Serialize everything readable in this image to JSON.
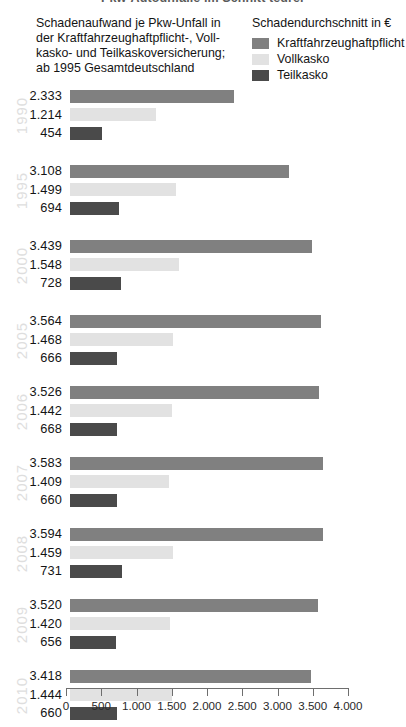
{
  "kicker": "Pkw-Autounfälle im Schnitt teurer",
  "title_lines": [
    "Schadenaufwand je Pkw-Unfall in",
    "der Kraftfahrzeughaftpflicht-, Voll-",
    "kasko- und Teilkaskoversicherung;",
    "ab 1995 Gesamtdeutschland"
  ],
  "legend": {
    "title": "Schadendurchschnitt in €",
    "items": [
      {
        "label": "Kraftfahrzeughaftpflicht",
        "color": "#808080",
        "icon": "legend-swatch-icon"
      },
      {
        "label": "Vollkasko",
        "color": "#e2e2e2",
        "icon": "legend-swatch-icon"
      },
      {
        "label": "Teilkasko",
        "color": "#4a4a4a",
        "icon": "legend-swatch-icon"
      }
    ]
  },
  "chart_data": {
    "type": "bar",
    "orientation": "horizontal",
    "xlabel": "Schadendurchschnitt in €",
    "ylabel": "",
    "xlim": [
      0,
      4000
    ],
    "grid": false,
    "legend_position": "top-right",
    "tick_labels": [
      "0",
      "500",
      "1.000",
      "1.500",
      "2.000",
      "2.500",
      "3.000",
      "3.500",
      "4.000"
    ],
    "tick_values": [
      0,
      500,
      1000,
      1500,
      2000,
      2500,
      3000,
      3500,
      4000
    ],
    "categories": [
      "1990",
      "1995",
      "2000",
      "2005",
      "2006",
      "2007",
      "2008",
      "2009",
      "2010"
    ],
    "series": [
      {
        "name": "Kraftfahrzeughaftpflicht",
        "color": "#808080",
        "values": [
          2333,
          3108,
          3439,
          3564,
          3526,
          3583,
          3594,
          3520,
          3418
        ],
        "labels": [
          "2.333",
          "3.108",
          "3.439",
          "3.564",
          "3.526",
          "3.583",
          "3.594",
          "3.520",
          "3.418"
        ]
      },
      {
        "name": "Vollkasko",
        "color": "#e2e2e2",
        "values": [
          1214,
          1499,
          1548,
          1468,
          1442,
          1409,
          1459,
          1420,
          1444
        ],
        "labels": [
          "1.214",
          "1.499",
          "1.548",
          "1.468",
          "1.442",
          "1.409",
          "1.459",
          "1.420",
          "1.444"
        ]
      },
      {
        "name": "Teilkasko",
        "color": "#4a4a4a",
        "values": [
          454,
          694,
          728,
          666,
          668,
          660,
          731,
          656,
          660
        ],
        "labels": [
          "454",
          "694",
          "728",
          "666",
          "668",
          "660",
          "731",
          "656",
          "660"
        ]
      }
    ]
  }
}
